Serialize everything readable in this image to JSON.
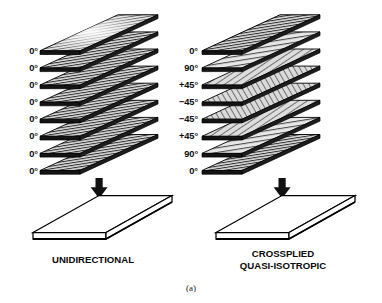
{
  "figure": {
    "letter": "(a)"
  },
  "stacks": [
    {
      "id": "unidirectional",
      "caption": "UNIDIRECTIONAL",
      "ply_count": 8,
      "plies": [
        {
          "angle_label": "0°",
          "angle_deg": 0,
          "texture": "speckled"
        },
        {
          "angle_label": "0°",
          "angle_deg": 0,
          "texture": "hatch"
        },
        {
          "angle_label": "0°",
          "angle_deg": 0,
          "texture": "hatch"
        },
        {
          "angle_label": "0°",
          "angle_deg": 0,
          "texture": "hatch"
        },
        {
          "angle_label": "0°",
          "angle_deg": 0,
          "texture": "hatch"
        },
        {
          "angle_label": "0°",
          "angle_deg": 0,
          "texture": "hatch"
        },
        {
          "angle_label": "0°",
          "angle_deg": 0,
          "texture": "hatch"
        },
        {
          "angle_label": "0°",
          "angle_deg": 0,
          "texture": "hatch"
        }
      ],
      "arrow": "down-arrow",
      "slab": "consolidated-laminate-slab"
    },
    {
      "id": "crossplied-quasi-isotropic",
      "caption": "CROSSPLIED\nQUASI-ISOTROPIC",
      "caption_line1": "CROSSPLIED",
      "caption_line2": "QUASI-ISOTROPIC",
      "ply_count": 8,
      "plies": [
        {
          "angle_label": "0°",
          "angle_deg": 0,
          "texture": "hatch"
        },
        {
          "angle_label": "90°",
          "angle_deg": 90,
          "texture": "hatch"
        },
        {
          "angle_label": "+45°",
          "angle_deg": 45,
          "texture": "hatch"
        },
        {
          "angle_label": "−45°",
          "angle_deg": -45,
          "texture": "hatch"
        },
        {
          "angle_label": "−45°",
          "angle_deg": -45,
          "texture": "hatch"
        },
        {
          "angle_label": "+45°",
          "angle_deg": 45,
          "texture": "hatch"
        },
        {
          "angle_label": "90°",
          "angle_deg": 90,
          "texture": "hatch"
        },
        {
          "angle_label": "0°",
          "angle_deg": 0,
          "texture": "hatch"
        }
      ],
      "arrow": "down-arrow",
      "slab": "consolidated-laminate-slab"
    }
  ],
  "colors": {
    "background": "#ffffff",
    "ink": "#000000",
    "ply_fill": "#d8d8d8",
    "ply_fill_light": "#ececec",
    "hatch_line": "#3a3a3a",
    "slab_fill": "#ffffff",
    "arrow": "#111111"
  }
}
